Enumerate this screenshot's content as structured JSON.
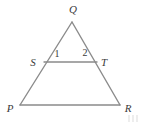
{
  "figure": {
    "type": "geometry-diagram",
    "background_color": "#ffffff",
    "stroke_color": "#8b8b8b",
    "label_color": "#3a3a3a",
    "stroke_width": 1.4,
    "width": 141,
    "height": 125
  },
  "points": {
    "Q": {
      "label": "Q",
      "x": 72,
      "y": 22,
      "label_x": 73,
      "label_y": 9
    },
    "P": {
      "label": "P",
      "x": 20,
      "y": 105,
      "label_x": 10,
      "label_y": 108
    },
    "R": {
      "label": "R",
      "x": 120,
      "y": 105,
      "label_x": 128,
      "label_y": 108
    },
    "S": {
      "label": "S",
      "x": 44,
      "y": 62,
      "label_x": 33,
      "label_y": 62
    },
    "T": {
      "label": "T",
      "x": 97,
      "y": 62,
      "label_x": 104,
      "label_y": 62
    }
  },
  "angles": [
    {
      "label": "1",
      "x": 57,
      "y": 54,
      "at_vertex": "S"
    },
    {
      "label": "2",
      "x": 85,
      "y": 53,
      "at_vertex": "T"
    }
  ],
  "segments": [
    {
      "name": "QP",
      "from": "Q",
      "to": "P"
    },
    {
      "name": "QR",
      "from": "Q",
      "to": "R"
    },
    {
      "name": "PR",
      "from": "P",
      "to": "R"
    },
    {
      "name": "ST",
      "from": "S",
      "to": "T"
    }
  ]
}
